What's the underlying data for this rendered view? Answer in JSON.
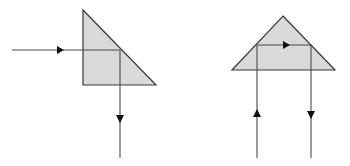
{
  "diagram": {
    "colors": {
      "prism_fill": "#d9d9d9",
      "prism_stroke": "#3a3a3a",
      "ray": "#4a4a4a",
      "arrow": "#111111"
    },
    "prisms": [
      {
        "id": "prism-90-deflection",
        "label": "90° deflection prism",
        "points": "83,10 156,85 83,85",
        "ray_path": "12,50 120,50 120,158",
        "arrows": [
          {
            "x": 60,
            "y": 50,
            "dir": "right"
          },
          {
            "x": 120,
            "y": 118,
            "dir": "down"
          }
        ]
      },
      {
        "id": "prism-180-retroreflector",
        "label": "180° reflection prism",
        "points": "283,16 335,70 232,70",
        "ray_path": "257,158 257,45 311,45 311,158",
        "arrows": [
          {
            "x": 257,
            "y": 114,
            "dir": "up"
          },
          {
            "x": 286,
            "y": 45,
            "dir": "right"
          },
          {
            "x": 311,
            "y": 114,
            "dir": "down"
          }
        ]
      }
    ]
  }
}
